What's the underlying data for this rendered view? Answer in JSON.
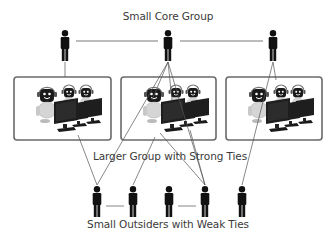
{
  "diagram": {
    "labels": {
      "core": "Small Core Group",
      "strong": "Larger Group with Strong Ties",
      "weak": "Small Outsiders with Weak Ties"
    },
    "colors": {
      "figure": "#111111",
      "line": "#555555",
      "box_border": "#6a6a6a",
      "label": "#3a3a3a",
      "robot_body": "#d8d8d8",
      "robot_face": "#1a1a1a",
      "monitor": "#1e1e1e"
    },
    "core_figures": [
      {
        "id": "core-left",
        "x": 65,
        "y": 30
      },
      {
        "id": "core-center",
        "x": 168,
        "y": 30
      },
      {
        "id": "core-right",
        "x": 273,
        "y": 30
      }
    ],
    "groups": [
      {
        "id": "group-1",
        "x": 14,
        "y": 77,
        "w": 97,
        "h": 63
      },
      {
        "id": "group-2",
        "x": 121,
        "y": 77,
        "w": 95,
        "h": 63
      },
      {
        "id": "group-3",
        "x": 226,
        "y": 77,
        "w": 96,
        "h": 63
      }
    ],
    "outsider_figures": [
      {
        "id": "outsider-1",
        "x": 97,
        "y": 186
      },
      {
        "id": "outsider-2",
        "x": 133,
        "y": 186
      },
      {
        "id": "outsider-3",
        "x": 169,
        "y": 186
      },
      {
        "id": "outsider-4",
        "x": 205,
        "y": 186
      },
      {
        "id": "outsider-5",
        "x": 242,
        "y": 186
      }
    ]
  }
}
